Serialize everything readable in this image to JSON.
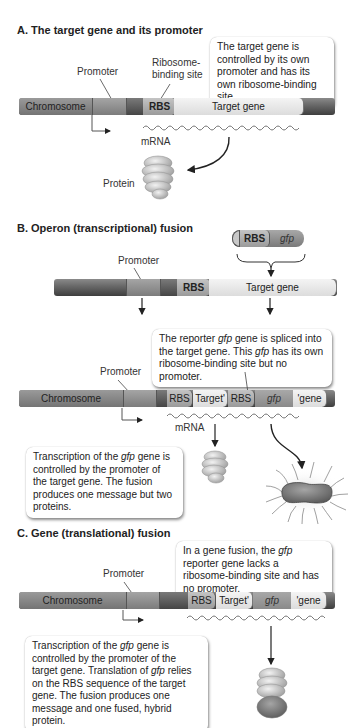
{
  "sectionA": {
    "title": "A. The target gene and its promoter",
    "callout": "The target gene is controlled by its own promoter and has its own ribosome-binding site.",
    "labels": {
      "promoter": "Promoter",
      "rbs_site_line1": "Ribosome-",
      "rbs_site_line2": "binding site",
      "chromosome": "Chromosome",
      "rbs": "RBS",
      "target_gene": "Target gene",
      "mrna": "mRNA",
      "protein": "Protein"
    }
  },
  "sectionB": {
    "title": "B. Operon (transcriptional) fusion",
    "insert": {
      "rbs": "RBS",
      "gfp": "gfp"
    },
    "labels": {
      "promoter_top": "Promoter",
      "rbs_top": "RBS",
      "target_gene_top": "Target gene",
      "promoter": "Promoter",
      "chromosome": "Chromosome",
      "rbs1": "RBS",
      "target_prime": "Target'",
      "rbs2": "RBS",
      "gfp": "gfp",
      "gene_prime": "'gene",
      "mrna": "mRNA"
    },
    "callout_top": {
      "part1": "The reporter ",
      "gfp1": "gfp",
      "part2": " gene is spliced into the target gene. This ",
      "gfp2": "gfp",
      "part3": " has its own ribosome-binding site but no promoter."
    },
    "callout_bottom": {
      "part1": "Transcription of the ",
      "gfp": "gfp",
      "part2": " gene is controlled by the promoter of the target gene. The fusion produces one message but two proteins."
    }
  },
  "sectionC": {
    "title": "C. Gene (translational) fusion",
    "callout_top": {
      "part1": "In a gene fusion, the ",
      "gfp": "gfp",
      "part2": " reporter gene lacks a ribosome-binding site and has no promoter."
    },
    "labels": {
      "promoter": "Promoter",
      "chromosome": "Chromosome",
      "rbs": "RBS",
      "target_prime": "Target'",
      "gfp": "gfp",
      "gene_prime": "'gene"
    },
    "callout_bottom": {
      "part1": "Transcription of the ",
      "gfp1": "gfp",
      "part2": " gene is controlled by the promoter of the target gene. Translation of ",
      "gfp2": "gfp",
      "part3": " relies on the RBS sequence of the target gene. The fusion produces one message and one fused, hybrid protein."
    }
  },
  "colors": {
    "chromosome_dark": "#4a4a4a",
    "promoter": "#8e8e8e",
    "rbs": "#adadad",
    "target_gene": "#ebebeb",
    "gfp": "#999999",
    "text": "#222222"
  }
}
